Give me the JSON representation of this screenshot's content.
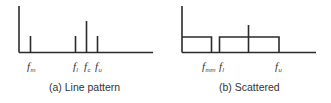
{
  "panels": [
    {
      "id": "a",
      "caption": "(a) Line pattern",
      "type": "line-spectrum",
      "labels": [
        {
          "base": "f",
          "sub": "m"
        },
        {
          "base": "f",
          "sub": "l"
        },
        {
          "base": "f",
          "sub": "c"
        },
        {
          "base": "f",
          "sub": "u"
        }
      ]
    },
    {
      "id": "b",
      "caption": "(b) Scattered",
      "type": "scattered-spectrum",
      "labels": [
        {
          "base": "f",
          "sub": "mm"
        },
        {
          "base": "f",
          "sub": "l"
        },
        {
          "base": "f",
          "sub": "u"
        }
      ]
    }
  ],
  "colors": {
    "line": "#2b2b2b",
    "text": "#333333",
    "background": "#ffffff"
  }
}
